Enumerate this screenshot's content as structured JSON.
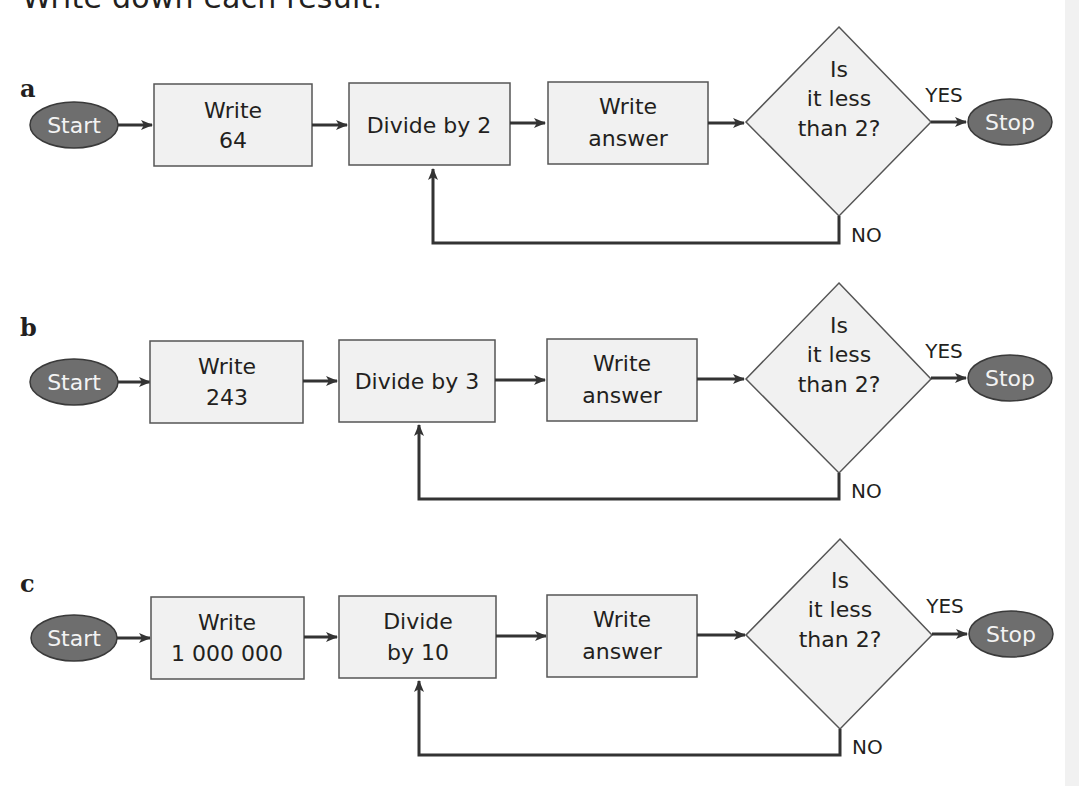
{
  "instruction": "Write down each result.",
  "colors": {
    "oval_fill": "#6e6e6e",
    "oval_stroke": "#3a3a3a",
    "box_fill": "#f1f1f1",
    "box_stroke": "#555555",
    "arrow": "#333333",
    "text": "#231f20"
  },
  "diagrams": [
    {
      "label": "a",
      "start": "Start",
      "write_box": [
        "Write",
        "64"
      ],
      "divide_box": [
        "Divide by 2"
      ],
      "answer_box": [
        "Write",
        "answer"
      ],
      "decision": [
        "Is",
        "it less",
        "than 2?"
      ],
      "yes": "YES",
      "no": "NO",
      "stop": "Stop"
    },
    {
      "label": "b",
      "start": "Start",
      "write_box": [
        "Write",
        "243"
      ],
      "divide_box": [
        "Divide by 3"
      ],
      "answer_box": [
        "Write",
        "answer"
      ],
      "decision": [
        "Is",
        "it less",
        "than 2?"
      ],
      "yes": "YES",
      "no": "NO",
      "stop": "Stop"
    },
    {
      "label": "c",
      "start": "Start",
      "write_box": [
        "Write",
        "1 000 000"
      ],
      "divide_box": [
        "Divide",
        "by 10"
      ],
      "answer_box": [
        "Write",
        "answer"
      ],
      "decision": [
        "Is",
        "it less",
        "than 2?"
      ],
      "yes": "YES",
      "no": "NO",
      "stop": "Stop"
    }
  ]
}
